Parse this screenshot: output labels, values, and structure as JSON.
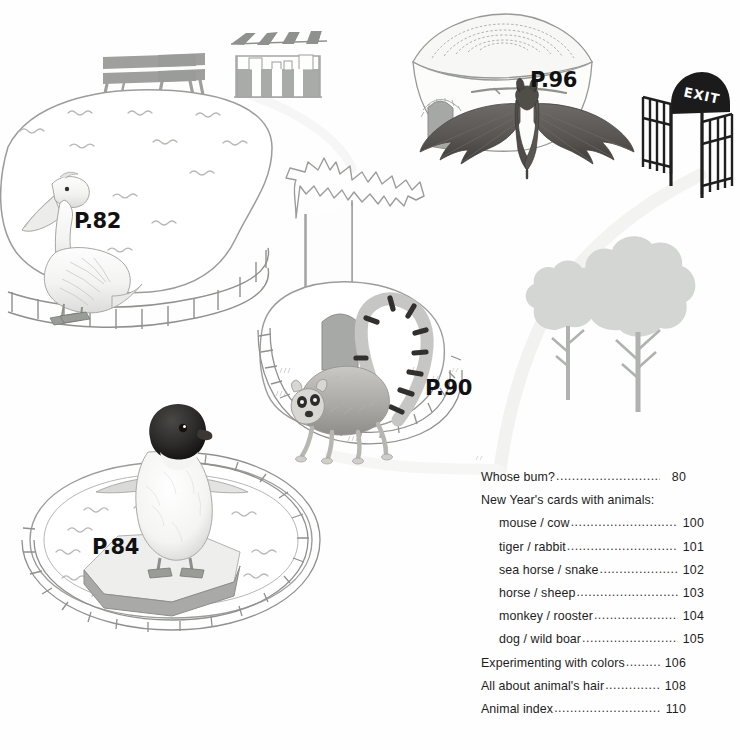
{
  "page": {
    "type": "illustrated-zoo-map-contents",
    "background_color": "#fefefe",
    "width": 740,
    "height": 750
  },
  "map_labels": [
    {
      "id": "pelican",
      "text": "P.82",
      "animal": "pelican",
      "color": "#111111"
    },
    {
      "id": "penguin",
      "text": "P.84",
      "animal": "penguin",
      "color": "#111111"
    },
    {
      "id": "lemur",
      "text": "P.90",
      "animal": "ring-tailed lemur",
      "color": "#111111"
    },
    {
      "id": "bat",
      "text": "P.96",
      "animal": "bat",
      "color": "#111111"
    }
  ],
  "signage": {
    "exit_sign": "EXIT"
  },
  "scenery": {
    "bench_count": 2,
    "kiosk": "striped-awning stall",
    "dome_building": "thatched round hut with arched door",
    "baobab_tree": "outlined baobab tree",
    "trees": 2,
    "ice_floe": "hexagonal ice platform",
    "ponds": 2,
    "fence": "post-and-rail enclosure fence",
    "colors": {
      "tree_fill": "#d4d6d3",
      "tree_trunk": "#b0b2af",
      "bench_fill": "#9a9c99",
      "kiosk_fill": "#a9aba8",
      "ice_top": "#e6e7e5",
      "ice_side": "#a9aaa7",
      "dome_roof": "#f2f2f1",
      "dome_door": "#a6a8a5",
      "exit_sign_fill": "#1b1b1b",
      "outline": "#8c8e8b",
      "water_wave": "#b6b8b5",
      "path": "#f0f0ef"
    }
  },
  "contents": {
    "entries": [
      {
        "title": "Whose bum?",
        "page": "80",
        "indent": false,
        "dots": true
      },
      {
        "title": "New Year's cards with animals:",
        "page": "",
        "indent": false,
        "dots": false
      },
      {
        "title": "mouse / cow",
        "page": "100",
        "indent": true,
        "dots": true
      },
      {
        "title": "tiger / rabbit",
        "page": "101",
        "indent": true,
        "dots": true
      },
      {
        "title": "sea horse / snake",
        "page": "102",
        "indent": true,
        "dots": true
      },
      {
        "title": "horse / sheep",
        "page": "103",
        "indent": true,
        "dots": true
      },
      {
        "title": "monkey / rooster",
        "page": "104",
        "indent": true,
        "dots": true
      },
      {
        "title": "dog / wild boar",
        "page": "105",
        "indent": true,
        "dots": true
      },
      {
        "title": "Experimenting with colors",
        "page": "106",
        "indent": false,
        "dots": true
      },
      {
        "title": "All about animal's hair",
        "page": "108",
        "indent": false,
        "dots": true
      },
      {
        "title": "Animal index",
        "page": "110",
        "indent": false,
        "dots": true
      }
    ],
    "leader": "........................................................"
  }
}
